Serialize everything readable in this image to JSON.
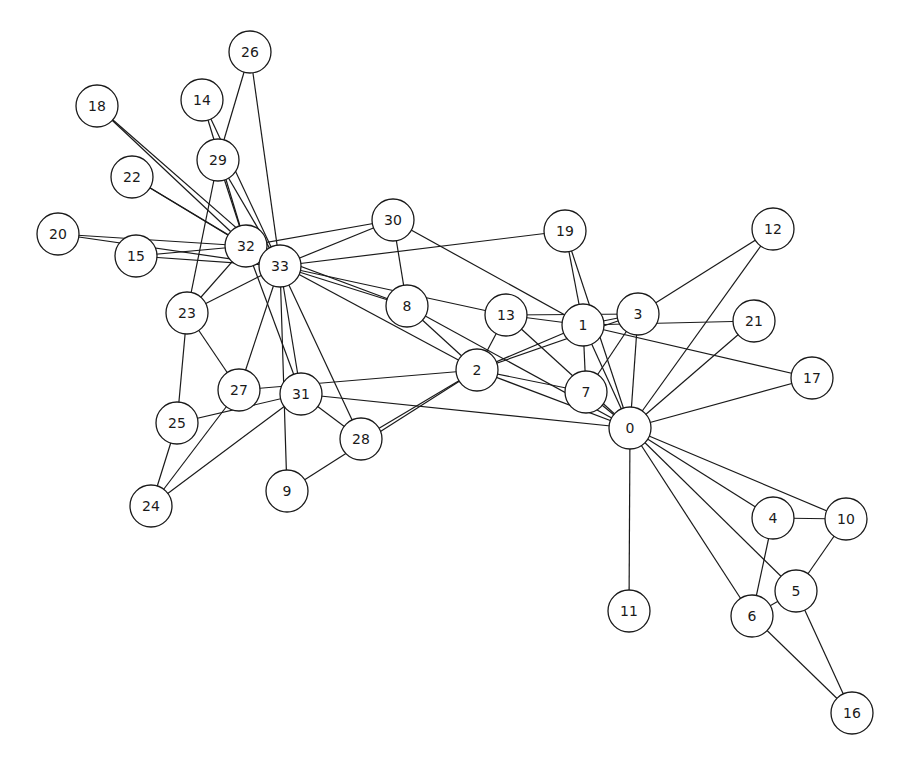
{
  "diagram": {
    "title": "",
    "type": "network-graph",
    "node_radius": 21,
    "colors": {
      "node_fill": "#ffffff",
      "stroke": "#1a1a1a",
      "background": "#ffffff"
    },
    "nodes": [
      {
        "id": "0",
        "x": 630,
        "y": 428
      },
      {
        "id": "1",
        "x": 583,
        "y": 325
      },
      {
        "id": "2",
        "x": 477,
        "y": 370
      },
      {
        "id": "3",
        "x": 638,
        "y": 314
      },
      {
        "id": "4",
        "x": 773,
        "y": 518
      },
      {
        "id": "5",
        "x": 796,
        "y": 591
      },
      {
        "id": "6",
        "x": 752,
        "y": 616
      },
      {
        "id": "7",
        "x": 586,
        "y": 392
      },
      {
        "id": "8",
        "x": 407,
        "y": 306
      },
      {
        "id": "9",
        "x": 287,
        "y": 491
      },
      {
        "id": "10",
        "x": 846,
        "y": 519
      },
      {
        "id": "11",
        "x": 629,
        "y": 611
      },
      {
        "id": "12",
        "x": 773,
        "y": 229
      },
      {
        "id": "13",
        "x": 506,
        "y": 315
      },
      {
        "id": "14",
        "x": 202,
        "y": 100
      },
      {
        "id": "15",
        "x": 136,
        "y": 256
      },
      {
        "id": "16",
        "x": 852,
        "y": 713
      },
      {
        "id": "17",
        "x": 812,
        "y": 378
      },
      {
        "id": "18",
        "x": 97,
        "y": 106
      },
      {
        "id": "19",
        "x": 565,
        "y": 231
      },
      {
        "id": "20",
        "x": 58,
        "y": 234
      },
      {
        "id": "21",
        "x": 754,
        "y": 321
      },
      {
        "id": "22",
        "x": 132,
        "y": 177
      },
      {
        "id": "23",
        "x": 187,
        "y": 313
      },
      {
        "id": "24",
        "x": 151,
        "y": 506
      },
      {
        "id": "25",
        "x": 177,
        "y": 423
      },
      {
        "id": "26",
        "x": 250,
        "y": 52
      },
      {
        "id": "27",
        "x": 239,
        "y": 390
      },
      {
        "id": "28",
        "x": 361,
        "y": 439
      },
      {
        "id": "29",
        "x": 218,
        "y": 160
      },
      {
        "id": "30",
        "x": 393,
        "y": 220
      },
      {
        "id": "31",
        "x": 301,
        "y": 394
      },
      {
        "id": "32",
        "x": 246,
        "y": 246
      },
      {
        "id": "33",
        "x": 280,
        "y": 266
      }
    ],
    "edges": [
      [
        "0",
        "1"
      ],
      [
        "0",
        "2"
      ],
      [
        "0",
        "3"
      ],
      [
        "0",
        "4"
      ],
      [
        "0",
        "5"
      ],
      [
        "0",
        "6"
      ],
      [
        "0",
        "7"
      ],
      [
        "0",
        "8"
      ],
      [
        "0",
        "10"
      ],
      [
        "0",
        "11"
      ],
      [
        "0",
        "12"
      ],
      [
        "0",
        "13"
      ],
      [
        "0",
        "17"
      ],
      [
        "0",
        "19"
      ],
      [
        "0",
        "21"
      ],
      [
        "0",
        "31"
      ],
      [
        "1",
        "2"
      ],
      [
        "1",
        "3"
      ],
      [
        "1",
        "7"
      ],
      [
        "1",
        "13"
      ],
      [
        "1",
        "17"
      ],
      [
        "1",
        "19"
      ],
      [
        "1",
        "21"
      ],
      [
        "1",
        "30"
      ],
      [
        "2",
        "3"
      ],
      [
        "2",
        "7"
      ],
      [
        "2",
        "8"
      ],
      [
        "2",
        "9"
      ],
      [
        "2",
        "13"
      ],
      [
        "2",
        "27"
      ],
      [
        "2",
        "28"
      ],
      [
        "2",
        "32"
      ],
      [
        "3",
        "7"
      ],
      [
        "3",
        "12"
      ],
      [
        "3",
        "13"
      ],
      [
        "4",
        "6"
      ],
      [
        "4",
        "10"
      ],
      [
        "5",
        "6"
      ],
      [
        "5",
        "10"
      ],
      [
        "5",
        "16"
      ],
      [
        "6",
        "16"
      ],
      [
        "8",
        "30"
      ],
      [
        "8",
        "32"
      ],
      [
        "8",
        "33"
      ],
      [
        "9",
        "33"
      ],
      [
        "13",
        "33"
      ],
      [
        "14",
        "32"
      ],
      [
        "14",
        "33"
      ],
      [
        "15",
        "32"
      ],
      [
        "15",
        "33"
      ],
      [
        "18",
        "32"
      ],
      [
        "18",
        "33"
      ],
      [
        "19",
        "33"
      ],
      [
        "20",
        "32"
      ],
      [
        "20",
        "33"
      ],
      [
        "22",
        "32"
      ],
      [
        "22",
        "33"
      ],
      [
        "23",
        "25"
      ],
      [
        "23",
        "27"
      ],
      [
        "23",
        "29"
      ],
      [
        "23",
        "32"
      ],
      [
        "23",
        "33"
      ],
      [
        "24",
        "25"
      ],
      [
        "24",
        "27"
      ],
      [
        "24",
        "31"
      ],
      [
        "25",
        "31"
      ],
      [
        "26",
        "29"
      ],
      [
        "26",
        "33"
      ],
      [
        "27",
        "33"
      ],
      [
        "28",
        "31"
      ],
      [
        "28",
        "33"
      ],
      [
        "29",
        "32"
      ],
      [
        "29",
        "33"
      ],
      [
        "30",
        "32"
      ],
      [
        "30",
        "33"
      ],
      [
        "31",
        "32"
      ],
      [
        "31",
        "33"
      ],
      [
        "32",
        "33"
      ]
    ]
  }
}
